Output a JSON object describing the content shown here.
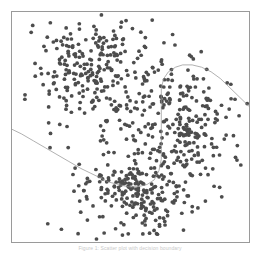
{
  "figure": {
    "background_color": "#ffffff",
    "frame_color": "#9a9a9a",
    "caption": "Figure 1: Scatter plot with decision boundary"
  },
  "chart_data": {
    "type": "scatter",
    "title": "",
    "subtitle": "",
    "xlabel": "",
    "ylabel": "",
    "xlim": [
      0,
      100
    ],
    "ylim": [
      0,
      100
    ],
    "grid": false,
    "legend": false,
    "legend_position": "none",
    "axis_ticks": false,
    "marker_color": "#4d4d4d",
    "marker_size": 1.6,
    "marker_shape": "circle",
    "annotations": [
      {
        "name": "decision-boundary",
        "kind": "curve",
        "color": "#8f8f8f",
        "width": 0.7,
        "description": "S-shaped separating curve: descends from left edge, flattens at bottom center, rises vertically, then arcs over the right cluster and falls to the right edge",
        "points": [
          [
            0,
            49
          ],
          [
            4,
            47
          ],
          [
            9,
            44
          ],
          [
            14,
            41
          ],
          [
            19,
            38
          ],
          [
            24,
            35
          ],
          [
            29,
            32
          ],
          [
            33,
            30
          ],
          [
            37,
            28
          ],
          [
            41,
            26
          ],
          [
            45,
            25
          ],
          [
            49,
            24
          ],
          [
            53,
            24
          ],
          [
            57,
            25
          ],
          [
            60,
            27
          ],
          [
            62,
            31
          ],
          [
            63,
            36
          ],
          [
            63,
            42
          ],
          [
            63,
            49
          ],
          [
            63,
            56
          ],
          [
            63,
            62
          ],
          [
            63,
            67
          ],
          [
            64,
            71
          ],
          [
            66,
            74
          ],
          [
            69,
            76
          ],
          [
            72,
            77
          ],
          [
            76,
            77
          ],
          [
            80,
            76
          ],
          [
            84,
            74
          ],
          [
            88,
            71
          ],
          [
            92,
            67
          ],
          [
            96,
            63
          ],
          [
            100,
            59
          ]
        ]
      }
    ],
    "clusters": [
      {
        "name": "upper-left-cluster",
        "center": [
          34,
          74
        ],
        "spread": [
          13,
          12
        ],
        "count": 260
      },
      {
        "name": "right-cluster",
        "center": [
          72,
          50
        ],
        "spread": [
          11,
          13
        ],
        "count": 250
      },
      {
        "name": "bottom-cluster",
        "center": [
          53,
          22
        ],
        "spread": [
          14,
          9
        ],
        "count": 230
      }
    ],
    "total_points": 740
  }
}
